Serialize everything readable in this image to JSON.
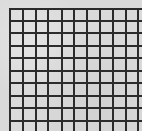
{
  "canvas": {
    "width": 142,
    "height": 131,
    "background": "#dadada"
  },
  "grid": {
    "line_color": "#2b2b2b",
    "line_width": 2,
    "origin_x": 9,
    "origin_y": 8,
    "right_edge": 142,
    "bottom_edge": 131,
    "vertical_lines_x": [
      9,
      22,
      35,
      47,
      61,
      73,
      86,
      99,
      112,
      125,
      137
    ],
    "horizontal_lines_y": [
      8,
      20,
      32,
      45,
      57,
      70,
      82,
      95,
      107,
      120
    ]
  }
}
